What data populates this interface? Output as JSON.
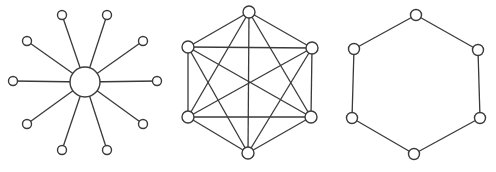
{
  "title": "",
  "colors": {
    "stroke": "#3a3a3a",
    "fill": "#ffffff",
    "background": "#ffffff"
  },
  "diagrams": [
    {
      "name": "star",
      "hub": {
        "x": 85,
        "y": 82,
        "r": 15
      },
      "node_radius": 4.5,
      "nodes": [
        {
          "x": 62,
          "y": 15
        },
        {
          "x": 107,
          "y": 15
        },
        {
          "x": 143,
          "y": 41
        },
        {
          "x": 157,
          "y": 81
        },
        {
          "x": 143,
          "y": 124
        },
        {
          "x": 107,
          "y": 150
        },
        {
          "x": 62,
          "y": 150
        },
        {
          "x": 27,
          "y": 124
        },
        {
          "x": 13,
          "y": 81
        },
        {
          "x": 27,
          "y": 41
        }
      ]
    },
    {
      "name": "fully-connected-mesh",
      "node_radius": 6,
      "nodes": [
        {
          "x": 249,
          "y": 12
        },
        {
          "x": 312,
          "y": 48
        },
        {
          "x": 311,
          "y": 117
        },
        {
          "x": 248,
          "y": 153
        },
        {
          "x": 188,
          "y": 117
        },
        {
          "x": 188,
          "y": 47
        }
      ],
      "edges": "all-pairs"
    },
    {
      "name": "ring",
      "node_radius": 5.5,
      "nodes": [
        {
          "x": 416,
          "y": 15
        },
        {
          "x": 478,
          "y": 50
        },
        {
          "x": 480,
          "y": 118
        },
        {
          "x": 414,
          "y": 154
        },
        {
          "x": 352,
          "y": 118
        },
        {
          "x": 354,
          "y": 49
        }
      ],
      "edges": "cycle"
    }
  ]
}
